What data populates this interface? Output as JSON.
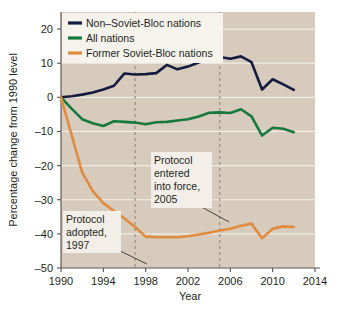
{
  "chart_data": {
    "type": "line",
    "title": "",
    "xlabel": "Year",
    "ylabel": "Percentage change from 1990 level",
    "xlim": [
      1990,
      2014
    ],
    "ylim": [
      -50,
      25
    ],
    "xticks": [
      1990,
      1994,
      1998,
      2002,
      2006,
      2010,
      2014
    ],
    "yticks": [
      20,
      10,
      0,
      -10,
      -20,
      -30,
      -40,
      -50
    ],
    "xtick_labels": [
      "1990",
      "1994",
      "1998",
      "2002",
      "2006",
      "2010",
      "2014"
    ],
    "ytick_labels": [
      "20",
      "10",
      "0",
      "–10",
      "–20",
      "–30",
      "–40",
      "–50"
    ],
    "grid": "horizontal-white",
    "legend_position": "top-left",
    "plot_background": "#d6cbbc",
    "x": [
      1990,
      1991,
      1992,
      1993,
      1994,
      1995,
      1996,
      1997,
      1998,
      1999,
      2000,
      2001,
      2002,
      2003,
      2004,
      2005,
      2006,
      2007,
      2008,
      2009,
      2010,
      2011,
      2012
    ],
    "series": [
      {
        "name": "Non–Soviet-Bloc nations",
        "color": "#161a3e",
        "values": [
          0.0,
          0.3,
          0.8,
          1.4,
          2.3,
          3.4,
          7.0,
          6.7,
          6.8,
          7.1,
          9.5,
          8.2,
          9.0,
          10.2,
          11.3,
          11.8,
          11.3,
          12.0,
          10.3,
          2.3,
          5.3,
          3.8,
          2.2
        ]
      },
      {
        "name": "All nations",
        "color": "#17793f",
        "values": [
          0.0,
          -3.3,
          -6.4,
          -7.6,
          -8.4,
          -7.0,
          -7.2,
          -7.4,
          -7.9,
          -7.3,
          -7.2,
          -6.8,
          -6.4,
          -5.6,
          -4.5,
          -4.4,
          -4.6,
          -3.5,
          -5.6,
          -11.2,
          -8.9,
          -9.2,
          -10.2
        ]
      },
      {
        "name": "Former Soviet-Bloc nations",
        "color": "#e08b3e",
        "values": [
          0.0,
          -11.0,
          -22.0,
          -27.5,
          -31.0,
          -33.3,
          -35.5,
          -38.0,
          -40.8,
          -41.0,
          -41.0,
          -41.0,
          -40.7,
          -40.2,
          -39.7,
          -39.0,
          -38.5,
          -37.6,
          -37.0,
          -41.3,
          -38.5,
          -37.8,
          -38.0
        ]
      }
    ],
    "annotations": [
      {
        "id": "protocol-adopted",
        "lines": [
          "Protocol",
          "adopted,",
          "1997"
        ],
        "target_year": 1997,
        "vline_year": 1997
      },
      {
        "id": "protocol-entered-force",
        "lines": [
          "Protocol",
          "entered",
          "into force,",
          "2005"
        ],
        "target_year": 2005,
        "vline_year": 2005
      }
    ],
    "vlines": [
      {
        "year": 1997,
        "style": "dashed",
        "color": "#8a8178"
      },
      {
        "year": 2005,
        "style": "dashed",
        "color": "#8a8178"
      }
    ]
  },
  "legend": {
    "items": [
      {
        "label": "Non–Soviet-Bloc nations",
        "color": "#161a3e"
      },
      {
        "label": "All nations",
        "color": "#17793f"
      },
      {
        "label": "Former Soviet-Bloc nations",
        "color": "#e08b3e"
      }
    ]
  }
}
